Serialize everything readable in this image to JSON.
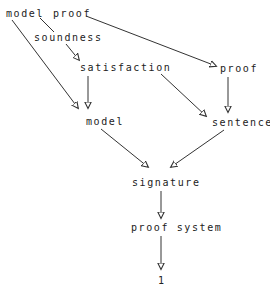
{
  "diagram": {
    "type": "directed-graph",
    "colors": {
      "line": "#333333",
      "text": "#222222",
      "background": "#ffffff"
    },
    "top_caption_fragment": "··· ··· ····· ·· ·····",
    "nodes": {
      "model_top": {
        "label": "model",
        "x": 6,
        "y": 9
      },
      "proof_top": {
        "label": "proof",
        "x": 53,
        "y": 9
      },
      "soundness": {
        "label": "soundness",
        "x": 34,
        "y": 33
      },
      "satisfaction": {
        "label": "satisfaction",
        "x": 80,
        "y": 63
      },
      "proof_right": {
        "label": "proof",
        "x": 220,
        "y": 64
      },
      "model_mid": {
        "label": "model",
        "x": 86,
        "y": 117
      },
      "sentence": {
        "label": "sentence",
        "x": 212,
        "y": 118
      },
      "signature": {
        "label": "signature",
        "x": 132,
        "y": 178
      },
      "proof_system": {
        "label": "proof system",
        "x": 131,
        "y": 223
      },
      "one": {
        "label": "1",
        "x": 158,
        "y": 276
      }
    },
    "edges": [
      {
        "from": "model_top",
        "to": "model_mid"
      },
      {
        "from": "model_top",
        "to": "soundness",
        "arrow": false
      },
      {
        "from": "soundness",
        "to": "satisfaction"
      },
      {
        "from": "proof_top",
        "to": "proof_right"
      },
      {
        "from": "satisfaction",
        "to": "model_mid"
      },
      {
        "from": "satisfaction",
        "to": "sentence"
      },
      {
        "from": "proof_right",
        "to": "sentence"
      },
      {
        "from": "model_mid",
        "to": "signature"
      },
      {
        "from": "sentence",
        "to": "signature"
      },
      {
        "from": "signature",
        "to": "proof_system"
      },
      {
        "from": "proof_system",
        "to": "one"
      }
    ]
  }
}
